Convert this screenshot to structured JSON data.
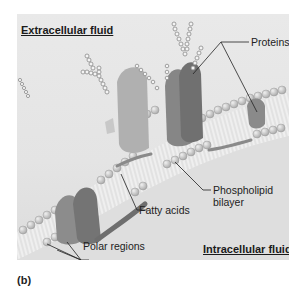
{
  "figure": {
    "panel_label": "(b)",
    "labels": {
      "extracellular": "Extracellular fluid",
      "intracellular": "Intracellular fluid",
      "proteins": "Proteins",
      "phospholipid_line1": "Phospholipid",
      "phospholipid_line2": "bilayer",
      "fatty_acids": "Fatty acids",
      "polar_regions": "Polar regions"
    },
    "colors": {
      "background": "#e6e6e6",
      "head": "#c9c9c9",
      "tail": "#f2f2f2",
      "protein_dark": "#7a7a7a",
      "protein_mid": "#9a9a9a",
      "protein_light": "#bdbdbd",
      "leader_line": "#222222"
    }
  }
}
